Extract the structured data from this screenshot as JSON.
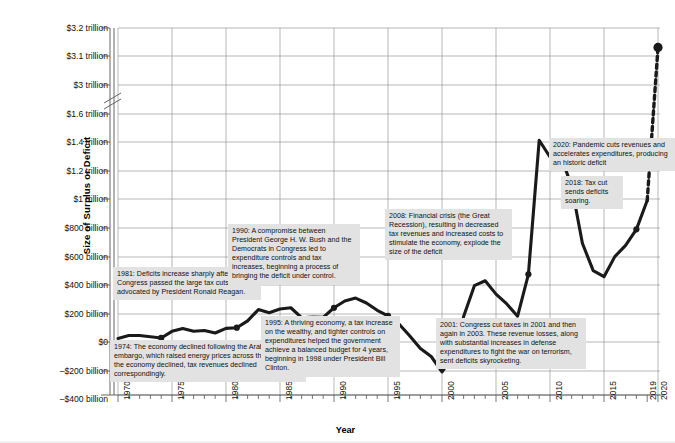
{
  "chart_data": {
    "type": "line",
    "title": "",
    "xlabel": "Year",
    "ylabel": "Size of Surplus or Deficit",
    "grid": true,
    "legend": null,
    "axis_break": {
      "between": [
        "$3 trillion",
        "$1.6 trillion"
      ],
      "note": "broken y-axis"
    },
    "y_tick_labels": [
      "$3.2 trillion",
      "$3.1 trillion",
      "$3 trillion",
      "$1.6 trillion",
      "$1.4 trillion",
      "$1.2 trillion",
      "$1 trillion",
      "$800 billion",
      "$600 billion",
      "$400 billion",
      "$200 billion",
      "$0",
      "–$200 billion",
      "–$400 billion"
    ],
    "y_tick_values": [
      3200,
      3100,
      3000,
      1600,
      1400,
      1200,
      1000,
      800,
      600,
      400,
      200,
      0,
      -200,
      -400
    ],
    "x_tick_labels": [
      "1970",
      "1975",
      "1980",
      "1985",
      "1990",
      "1995",
      "2000",
      "2005",
      "2010",
      "2015",
      "2019",
      "2020"
    ],
    "xlim": [
      1970,
      2020
    ],
    "x": [
      1970,
      1971,
      1972,
      1973,
      1974,
      1975,
      1976,
      1977,
      1978,
      1979,
      1980,
      1981,
      1982,
      1983,
      1984,
      1985,
      1986,
      1987,
      1988,
      1989,
      1990,
      1991,
      1992,
      1993,
      1994,
      1995,
      1996,
      1997,
      1998,
      1999,
      2000,
      2001,
      2002,
      2003,
      2004,
      2005,
      2006,
      2007,
      2008,
      2009,
      2010,
      2011,
      2012,
      2013,
      2014,
      2015,
      2016,
      2017,
      2018,
      2019,
      2020
    ],
    "values": [
      3,
      23,
      23,
      15,
      6,
      53,
      74,
      54,
      59,
      41,
      74,
      79,
      128,
      208,
      185,
      212,
      221,
      150,
      155,
      153,
      221,
      269,
      290,
      255,
      203,
      164,
      107,
      22,
      -69,
      -126,
      -236,
      -128,
      158,
      378,
      413,
      318,
      248,
      161,
      459,
      1413,
      1294,
      1300,
      1087,
      680,
      485,
      442,
      585,
      665,
      779,
      984,
      3132
    ],
    "units": "billions of US dollars (positive = deficit)",
    "marked_points": [
      {
        "year": 1974,
        "label": "1974"
      },
      {
        "year": 1981,
        "label": "1981"
      },
      {
        "year": 1990,
        "label": "1990"
      },
      {
        "year": 1995,
        "label": "1995"
      },
      {
        "year": 2001,
        "label": "2001"
      },
      {
        "year": 2008,
        "label": "2008"
      },
      {
        "year": 2018,
        "label": "2018"
      },
      {
        "year": 2020,
        "label": "2020"
      }
    ],
    "dashed_segment": {
      "from": 2019,
      "to": 2020,
      "note": "projected / broken-axis jump drawn dashed"
    },
    "annotations": [
      {
        "id": "a1974",
        "year": "1974",
        "text": "1974: The economy declined following the Arab oil embargo, which raised energy prices across the nation. As the economy declined, tax revenues declined correspondingly."
      },
      {
        "id": "a1981",
        "year": "1981",
        "text": "1981: Deficits increase sharply after Congress passed the large tax cuts advocated by President Ronald Reagan."
      },
      {
        "id": "a1990",
        "year": "1990",
        "text": "1990: A compromise between President George H. W. Bush and the Democrats in Congress led to expenditure controls and tax increases, beginning a process of bringing the deficit under control."
      },
      {
        "id": "a1995",
        "year": "1995",
        "text": "1995: A thriving economy, a tax increase on the wealthy, and tighter controls on expenditures helped the government achieve a balanced budget for 4 years, beginning in 1998 under President Bill Clinton."
      },
      {
        "id": "a2001",
        "year": "2001",
        "text": "2001: Congress cut taxes in 2001 and then again in 2003. These revenue losses, along with substantial increases in defense expenditures to fight the war on terrorism, sent deficits skyrocketing."
      },
      {
        "id": "a2008",
        "year": "2008",
        "text": "2008: Financial crisis (the Great Recession), resulting in decreased tax revenues and increased costs to stimulate the economy, explode the size of the deficit"
      },
      {
        "id": "a2018",
        "year": "2018",
        "text": "2018: Tax cut sends deficits soaring."
      },
      {
        "id": "a2020",
        "year": "2020",
        "text": "2020:  Pandemic cuts revenues and accelerates expenditures, producing an historic deficit"
      }
    ],
    "colors": {
      "line": "#1a1a1a",
      "grid": "#9a9a9a",
      "axis": "#555555",
      "annotation_background": "#e2e2e2",
      "background": "#ffffff"
    }
  }
}
